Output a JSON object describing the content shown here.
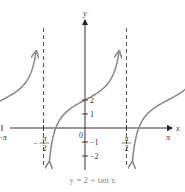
{
  "chart_data": {
    "type": "line",
    "title": "y = 2 + tan x",
    "function": "2 + tan(x)",
    "xlabel": "x",
    "ylabel": "y",
    "xlim": [
      -4.9,
      5.2
    ],
    "ylim": [
      -2.8,
      5.8
    ],
    "grid": false,
    "asymptotes": [
      "-3π/2",
      "-π/2",
      "π/2",
      "3π/2"
    ],
    "x_ticks": [
      {
        "value": -4.712,
        "label": "-3π/2"
      },
      {
        "value": -3.1416,
        "label": "-π"
      },
      {
        "value": -1.5708,
        "label": "-π/2"
      },
      {
        "value": 1.5708,
        "label": "π/2"
      },
      {
        "value": 3.1416,
        "label": "π"
      },
      {
        "value": 4.712,
        "label": "3π/2"
      }
    ],
    "y_ticks": [
      {
        "value": 2,
        "label": "2"
      },
      {
        "value": 1,
        "label": "1"
      },
      {
        "value": -1,
        "label": "-1"
      },
      {
        "value": -2,
        "label": "-2"
      }
    ],
    "origin_label": "0",
    "series": [
      {
        "name": "y = 2 + tan x",
        "branch_centers": [
          "-π",
          "0",
          "π"
        ],
        "sample_points": [
          [
            0,
            2
          ],
          [
            0.785,
            3
          ],
          [
            -0.785,
            1
          ],
          [
            -1.107,
            0
          ],
          [
            -1.25,
            -1
          ],
          [
            -1.326,
            -2
          ]
        ]
      }
    ]
  },
  "labels": {
    "caption": "y = 2 + tan x",
    "x_axis": "x",
    "y_axis": "y",
    "origin": "0"
  },
  "colors": {
    "curve": "#8c8c8c",
    "axis": "#333333",
    "asymptote": "#555555",
    "caption": "#8a8a8a"
  }
}
